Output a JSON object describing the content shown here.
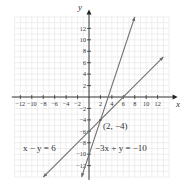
{
  "chart_data": {
    "type": "line",
    "title": "",
    "xlabel": "x",
    "ylabel": "y",
    "xlim": [
      -13,
      14
    ],
    "ylim": [
      -14,
      14
    ],
    "grid": true,
    "x_ticks": [
      -12,
      -10,
      -8,
      -6,
      -4,
      -2,
      2,
      4,
      6,
      8,
      10,
      12
    ],
    "y_ticks": [
      -12,
      -10,
      -8,
      -6,
      -4,
      -2,
      2,
      4,
      6,
      8,
      10,
      12
    ],
    "series": [
      {
        "name": "x − y = 6",
        "equation": "y = x - 6",
        "points": [
          [
            -8,
            -14
          ],
          [
            13,
            7
          ]
        ],
        "color": "#6e6e6e"
      },
      {
        "name": "−3x + y = −10",
        "equation": "y = 3x - 10",
        "points": [
          [
            -1.3,
            -14
          ],
          [
            8,
            14
          ]
        ],
        "color": "#6e6e6e"
      }
    ],
    "annotations": [
      {
        "text": "(2, −4)",
        "x": 2,
        "y": -4,
        "kind": "intersection"
      },
      {
        "text": "x − y = 6",
        "label_for": "series 0"
      },
      {
        "text": "−3x + y = −10",
        "label_for": "series 1"
      }
    ]
  },
  "labels": {
    "x_axis": "x",
    "y_axis": "y",
    "intersection": "(2, −4)",
    "line1": "x − y = 6",
    "line2": "−3x + y = −10"
  }
}
